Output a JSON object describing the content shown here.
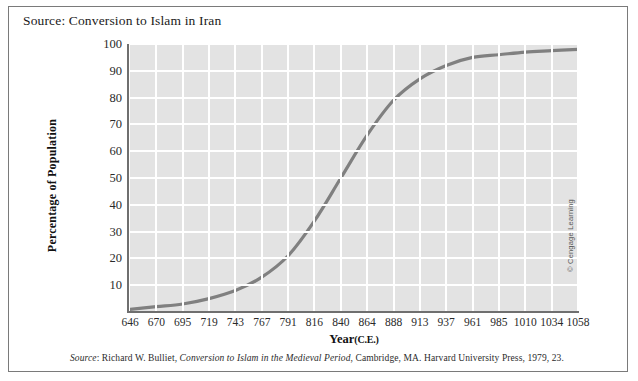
{
  "figure": {
    "title": "Source: Conversion to Islam in Iran",
    "source_note_prefix": "Source",
    "source_note_author": ": Richard W. Bulliet, ",
    "source_note_work": "Conversion to Islam in the Medieval Period",
    "source_note_rest": ", Cambridge, MA. Harvard University Press, 1979, 23.",
    "copyright": "© Cengage Learning"
  },
  "axis": {
    "x_title_main": "Year",
    "x_title_sub": "(C.E.)",
    "y_title": "Percentage of Population"
  },
  "colors": {
    "plot_background": "#e3e3e3",
    "gridline": "#ffffff",
    "curve": "#808080",
    "axis": "#6f6f6f",
    "frame": "#7a7a7a",
    "text": "#1a1a1a"
  },
  "chart_data": {
    "type": "line",
    "title": "Source: Conversion to Islam in Iran",
    "xlabel": "Year (C.E.)",
    "ylabel": "Percentage of Population",
    "xlim": [
      646,
      1058
    ],
    "ylim": [
      0,
      100
    ],
    "grid": true,
    "legend": null,
    "x_tick_labels": [
      "646",
      "670",
      "695",
      "719",
      "743",
      "767",
      "791",
      "816",
      "840",
      "864",
      "888",
      "913",
      "937",
      "961",
      "985",
      "1010",
      "1034",
      "1058"
    ],
    "y_tick_labels": [
      "10",
      "20",
      "30",
      "40",
      "50",
      "60",
      "70",
      "80",
      "90",
      "100"
    ],
    "y_ticks": [
      10,
      20,
      30,
      40,
      50,
      60,
      70,
      80,
      90,
      100
    ],
    "series": [
      {
        "name": "Conversion to Islam in Iran",
        "x": [
          646,
          670,
          695,
          719,
          743,
          767,
          791,
          816,
          840,
          864,
          888,
          913,
          937,
          961,
          985,
          1010,
          1034,
          1058
        ],
        "values": [
          1,
          2,
          3,
          5,
          8,
          13,
          21,
          34,
          50,
          66,
          79,
          87,
          92,
          95,
          96,
          97,
          97.5,
          98
        ]
      }
    ]
  }
}
